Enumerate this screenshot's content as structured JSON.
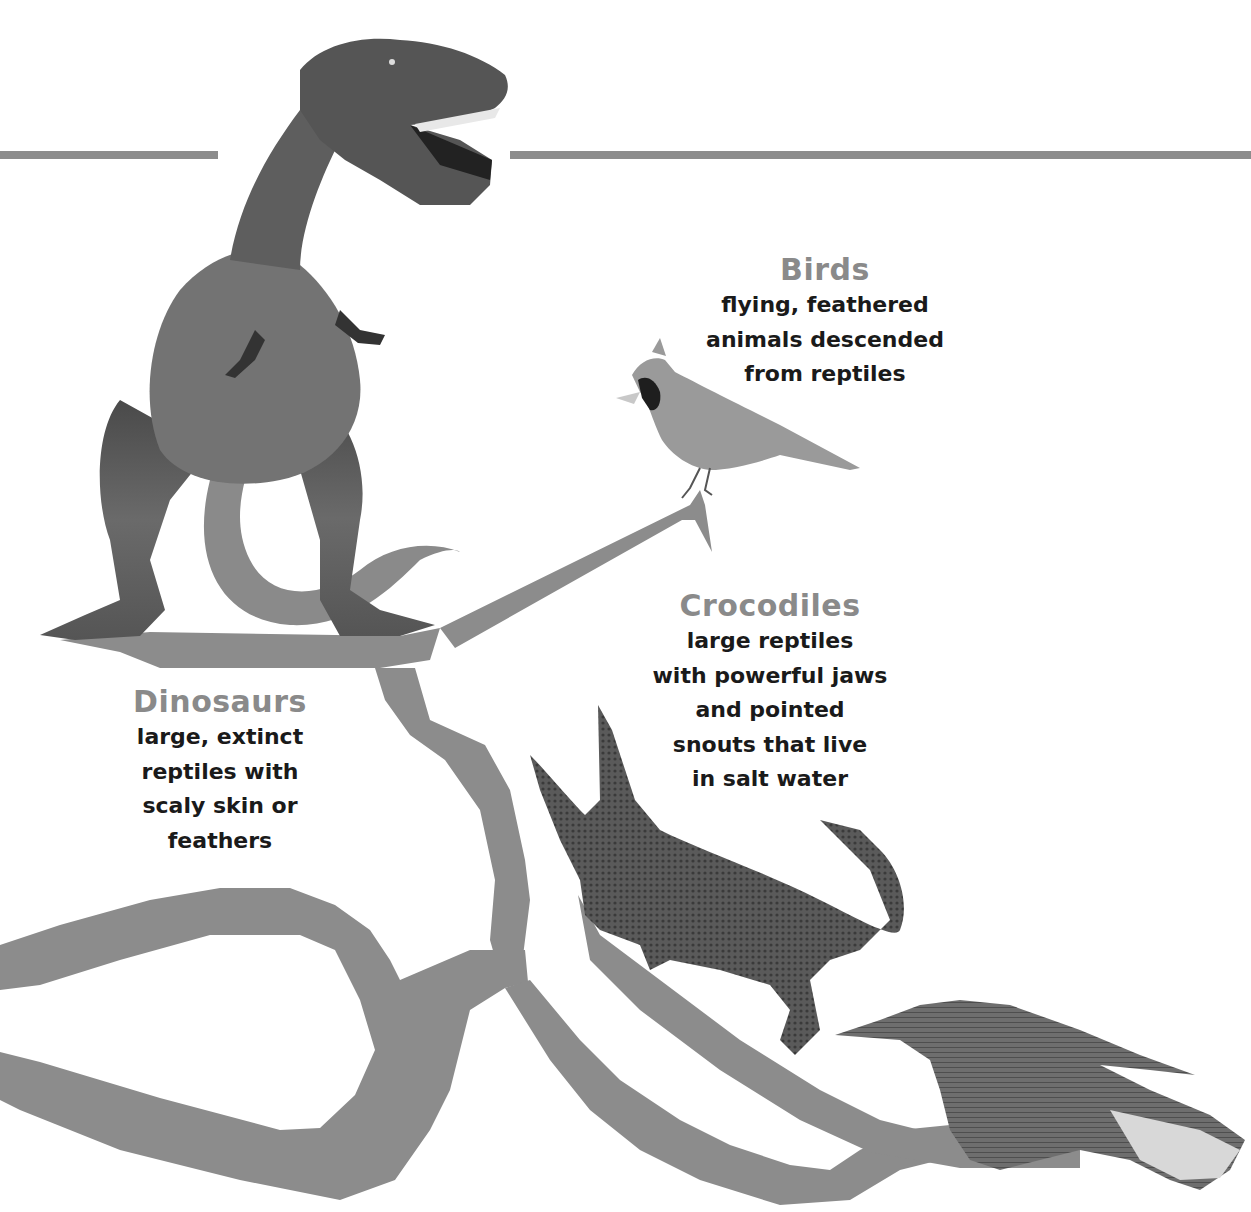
{
  "colors": {
    "background": "#ffffff",
    "branch": "#8c8c8c",
    "heading": "#8a8a8a",
    "body_text": "#1a1a1a"
  },
  "top_rule": {
    "segments": [
      {
        "x1": 0,
        "x2": 218,
        "y": 155
      },
      {
        "x1": 510,
        "x2": 1251,
        "y": 155
      }
    ]
  },
  "labels": {
    "birds": {
      "title": "Birds",
      "lines": [
        "flying, feathered",
        "animals descended",
        "from reptiles"
      ]
    },
    "crocodiles": {
      "title": "Crocodiles",
      "lines": [
        "large reptiles",
        "with powerful jaws",
        "and pointed",
        "snouts that live",
        "in salt water"
      ]
    },
    "dinosaurs": {
      "title": "Dinosaurs",
      "lines": [
        "large, extinct",
        "reptiles with",
        "scaly skin or",
        "feathers"
      ]
    }
  },
  "images": {
    "trex": "tyrannosaurus-rex",
    "bird": "cardinal",
    "crocodile": "crocodile",
    "alligator": "alligator"
  }
}
